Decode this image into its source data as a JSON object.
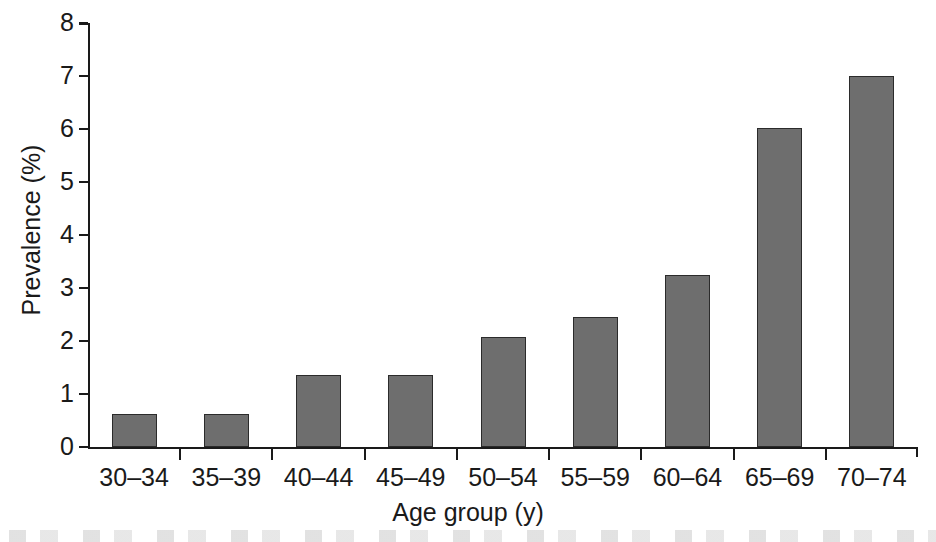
{
  "chart_data": {
    "type": "bar",
    "title": "",
    "subtitle": "",
    "xlabel": "Age group (y)",
    "ylabel": "Prevalence (%)",
    "categories": [
      "30–34",
      "35–39",
      "40–44",
      "45–49",
      "50–54",
      "55–59",
      "60–64",
      "65–69",
      "70–74"
    ],
    "values": [
      0.62,
      0.62,
      1.35,
      1.35,
      2.07,
      2.45,
      3.25,
      6.02,
      7.0
    ],
    "ylim": [
      0,
      8
    ],
    "yticks": [
      0,
      1,
      2,
      3,
      4,
      5,
      6,
      7,
      8
    ],
    "ytick_labels": [
      "0",
      "1",
      "2",
      "3",
      "4",
      "5",
      "6",
      "7",
      "8"
    ],
    "xlim_categories": 9,
    "grid": false,
    "legend": false,
    "legend_position": "none",
    "bar_color": "#6e6e6e",
    "bar_edge_color": "#2b2b2b",
    "axis_color": "#1a1a1a",
    "background_color": "#ffffff"
  }
}
